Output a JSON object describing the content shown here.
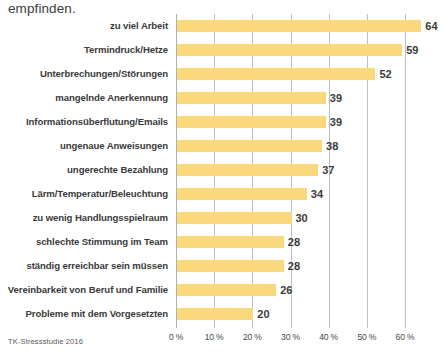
{
  "headline": "empfinden.",
  "source_note": "TK-Stressstudie 2016",
  "colors": {
    "bar": "#f9d97c",
    "gridline": "#b9c1c7",
    "text": "#3b3b3b"
  },
  "axis": {
    "ticks": [
      "0 %",
      "10 %",
      "20 %",
      "30 %",
      "40 %",
      "50 %",
      "60 %"
    ],
    "tick_values": [
      0,
      10,
      20,
      30,
      40,
      50,
      60
    ],
    "unit": "%"
  },
  "chart_data": {
    "type": "bar",
    "orientation": "horizontal",
    "title": "empfinden.",
    "subtitle": "",
    "xlabel": "",
    "ylabel": "",
    "xlim": [
      0,
      60
    ],
    "grid": true,
    "legend": false,
    "source": "TK-Stressstudie 2016",
    "value_suffix": "",
    "categories": [
      "zu viel Arbeit",
      "Termindruck/Hetze",
      "Unterbrechungen/Störungen",
      "mangelnde Anerkennung",
      "Informationsüberflutung/Emails",
      "ungenaue Anweisungen",
      "ungerechte Bezahlung",
      "Lärm/Temperatur/Beleuchtung",
      "zu wenig Handlungsspielraum",
      "schlechte Stimmung im Team",
      "ständig erreichbar sein müssen",
      "Vereinbarkeit von Beruf und Familie",
      "Probleme mit dem Vorgesetzten"
    ],
    "values": [
      64,
      59,
      52,
      39,
      39,
      38,
      37,
      34,
      30,
      28,
      28,
      26,
      20
    ],
    "labels": [
      "64",
      "59",
      "52",
      "39",
      "39",
      "38",
      "37",
      "34",
      "30",
      "28",
      "28",
      "26",
      "20"
    ]
  }
}
